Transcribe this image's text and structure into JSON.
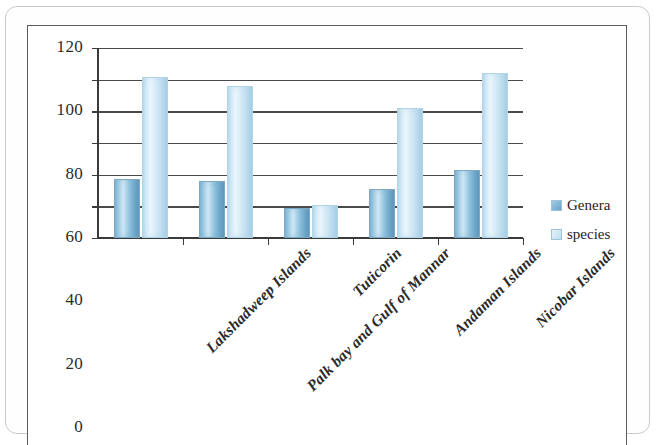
{
  "chart_data": {
    "type": "bar",
    "title": "",
    "xlabel": "",
    "ylabel": "",
    "ylim": [
      0,
      120
    ],
    "ytick_step": 20,
    "yticks": [
      120,
      100,
      80,
      60,
      40,
      20,
      0
    ],
    "grid": true,
    "legend_position": "right",
    "categories": [
      "Lakshadweep Islands",
      "Palk bay and Gulf of Mannar",
      "Tuticorin",
      "Andaman Islands",
      "Nicobar Islands"
    ],
    "series": [
      {
        "name": "Genera",
        "color": "#7fb4d4",
        "values": [
          37,
          36,
          19,
          31,
          43
        ]
      },
      {
        "name": "species",
        "color": "#cfe7f4",
        "values": [
          102,
          96,
          21,
          82,
          104
        ]
      }
    ]
  },
  "legend": {
    "items": [
      {
        "label": "Genera"
      },
      {
        "label": "species"
      }
    ]
  }
}
